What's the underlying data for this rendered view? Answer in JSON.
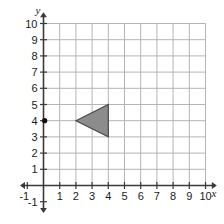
{
  "chart_data": {
    "type": "scatter",
    "title": "",
    "subtitle": "",
    "xlabel": "x",
    "ylabel": "y",
    "xlim": [
      -1,
      10
    ],
    "ylim": [
      -1,
      10
    ],
    "grid": true,
    "grid_spacing": 1,
    "legend": "none",
    "x_ticks": [
      -1,
      1,
      2,
      3,
      4,
      5,
      6,
      7,
      8,
      9,
      10
    ],
    "y_ticks": [
      -1,
      1,
      2,
      3,
      4,
      5,
      6,
      7,
      8,
      9,
      10
    ],
    "x_tick_labels": [
      "-1",
      "1",
      "2",
      "3",
      "4",
      "5",
      "6",
      "7",
      "8",
      "9",
      "10"
    ],
    "y_tick_labels": [
      "-1",
      "1",
      "2",
      "3",
      "4",
      "5",
      "6",
      "7",
      "8",
      "9",
      "10"
    ],
    "points": [
      {
        "name": "center-of-rotation-point",
        "x": 0,
        "y": 4,
        "label": "",
        "marker": "filled-circle"
      }
    ],
    "shapes": [
      {
        "name": "shaded-triangle",
        "kind": "polygon",
        "vertices": [
          {
            "x": 2,
            "y": 4
          },
          {
            "x": 4,
            "y": 5
          },
          {
            "x": 4,
            "y": 3
          }
        ],
        "fill": "#8c8c8c",
        "stroke": "#4a4a4a"
      }
    ],
    "annotations": []
  },
  "style": {
    "background": "#ffffff",
    "grid_color": "#b4b4b4",
    "grid_minor_color": "#d8d8d8",
    "axis_color": "#3a3a3a",
    "text_color": "#1a1a1a",
    "shape_fill": "#8c8c8c",
    "shape_stroke": "#4a4a4a",
    "point_color": "#111111"
  },
  "axis_labels": {
    "x_axis_name": "x",
    "y_axis_name": "y"
  },
  "x_tick_items": [
    {
      "value": -1,
      "label": "-1"
    },
    {
      "value": 1,
      "label": "1"
    },
    {
      "value": 2,
      "label": "2"
    },
    {
      "value": 3,
      "label": "3"
    },
    {
      "value": 4,
      "label": "4"
    },
    {
      "value": 5,
      "label": "5"
    },
    {
      "value": 6,
      "label": "6"
    },
    {
      "value": 7,
      "label": "7"
    },
    {
      "value": 8,
      "label": "8"
    },
    {
      "value": 9,
      "label": "9"
    },
    {
      "value": 10,
      "label": "10"
    }
  ],
  "y_tick_items": [
    {
      "value": 10,
      "label": "10"
    },
    {
      "value": 9,
      "label": "9"
    },
    {
      "value": 8,
      "label": "8"
    },
    {
      "value": 7,
      "label": "7"
    },
    {
      "value": 6,
      "label": "6"
    },
    {
      "value": 5,
      "label": "5"
    },
    {
      "value": 4,
      "label": "4"
    },
    {
      "value": 3,
      "label": "3"
    },
    {
      "value": 2,
      "label": "2"
    },
    {
      "value": 1,
      "label": "1"
    },
    {
      "value": -1,
      "label": "-1"
    }
  ]
}
